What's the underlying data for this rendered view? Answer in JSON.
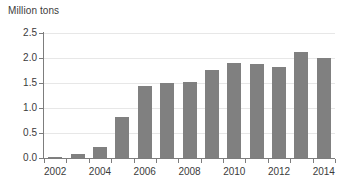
{
  "chart_data": {
    "type": "bar",
    "title": "Million tons",
    "xlabel": "",
    "ylabel": "",
    "categories": [
      "2002",
      "2003",
      "2004",
      "2005",
      "2006",
      "2007",
      "2008",
      "2009",
      "2010",
      "2011",
      "2012",
      "2013",
      "2014"
    ],
    "values": [
      0.03,
      0.08,
      0.22,
      0.82,
      1.45,
      1.51,
      1.53,
      1.76,
      1.91,
      1.88,
      1.83,
      2.13,
      2.0
    ],
    "ylim": [
      0.0,
      2.5
    ],
    "y_ticks": [
      "0.0",
      "0.5",
      "1.0",
      "1.5",
      "2.0",
      "2.5"
    ],
    "y_tick_values": [
      0.0,
      0.5,
      1.0,
      1.5,
      2.0,
      2.5
    ],
    "x_tick_labels": [
      "2002",
      "2004",
      "2006",
      "2008",
      "2010",
      "2012",
      "2014"
    ],
    "grid": true,
    "legend": null,
    "bar_color": "#808080",
    "axis_color": "#7d7d7d",
    "grid_color": "#e7e7e7",
    "text_color": "#3b3b3b",
    "background": "#ffffff"
  }
}
